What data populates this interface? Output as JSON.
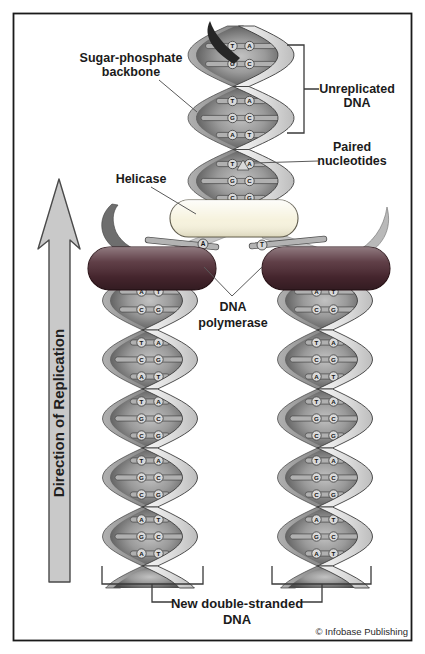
{
  "figure": {
    "copyright": "© Infobase Publishing"
  },
  "labels": {
    "sugar_phosphate": {
      "line1": "Sugar-phosphate",
      "line2": "backbone"
    },
    "unreplicated": {
      "line1": "Unreplicated",
      "line2": "DNA"
    },
    "paired_nucleotides": {
      "line1": "Paired",
      "line2": "nucleotides"
    },
    "helicase": "Helicase",
    "dna_polymerase": {
      "line1": "DNA",
      "line2": "polymerase"
    },
    "direction": "Direction of Replication",
    "new_dna": {
      "line1": "New double-stranded",
      "line2": "DNA"
    }
  },
  "colors": {
    "helicase": "#f6f2dd",
    "polymerase": "#4e2a33",
    "arrow": "#c9c9c9",
    "ribbon_front": "#e3e3e3",
    "ribbon_back": "#9b9b9b",
    "frame": "#1a1a1a"
  },
  "helices": {
    "unreplicated": {
      "eyes": [
        [
          "T-A",
          "G-C"
        ],
        [
          "T-A",
          "G-C",
          "A-T"
        ],
        [
          "T-A",
          "G-C",
          "C-G"
        ]
      ]
    },
    "left_new": {
      "eyes": [
        [
          "A-T",
          "C-G"
        ],
        [
          "T-A",
          "C-G",
          "A-T"
        ],
        [
          "T-A",
          "G-C",
          "C-G"
        ],
        [
          "T-A",
          "G-C",
          "C-G"
        ],
        [
          "A-T",
          "G-C",
          "A-T"
        ]
      ]
    },
    "right_new": {
      "eyes": [
        [
          "A-T",
          "C-G"
        ],
        [
          "T-A",
          "C-G",
          "A-T"
        ],
        [
          "T-A",
          "G-C",
          "C-G"
        ],
        [
          "T-A",
          "G-C",
          "C-G"
        ],
        [
          "A-T",
          "G-C",
          "A-T"
        ]
      ]
    }
  },
  "fork_bases": {
    "left": "A",
    "right": "T"
  }
}
